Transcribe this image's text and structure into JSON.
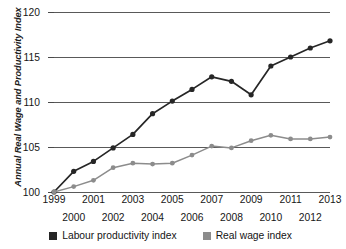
{
  "chart_data": {
    "type": "line",
    "title": "",
    "xlabel": "",
    "ylabel": "Annual Real Wage and Productivity Index",
    "ylim": [
      100,
      120
    ],
    "yticks": [
      100,
      105,
      110,
      115,
      120
    ],
    "grid": true,
    "legend_position": "bottom",
    "categories": [
      "1999",
      "2000",
      "2001",
      "2002",
      "2003",
      "2004",
      "2005",
      "2006",
      "2007",
      "2008",
      "2009",
      "2010",
      "2011",
      "2012",
      "2013"
    ],
    "series": [
      {
        "name": "Labour productivity index",
        "color": "#262626",
        "values": [
          100.0,
          102.3,
          103.4,
          104.9,
          106.4,
          108.7,
          110.1,
          111.4,
          112.8,
          112.3,
          110.8,
          114.0,
          115.0,
          116.0,
          116.8
        ]
      },
      {
        "name": "Real wage index",
        "color": "#8c8c8c",
        "values": [
          100.0,
          100.6,
          101.3,
          102.7,
          103.2,
          103.1,
          103.2,
          104.1,
          105.1,
          104.9,
          105.7,
          106.3,
          105.9,
          105.9,
          106.1
        ]
      }
    ]
  },
  "axes": {
    "ytick_labels": [
      "120",
      "115",
      "110",
      "105",
      "100"
    ],
    "xtick_labels": [
      "1999",
      "2000",
      "2001",
      "2002",
      "2003",
      "2004",
      "2005",
      "2006",
      "2007",
      "2008",
      "2009",
      "2010",
      "2011",
      "2012",
      "2013"
    ]
  },
  "legend": {
    "items": [
      {
        "label": "Labour productivity index",
        "color": "#262626"
      },
      {
        "label": "Real wage index",
        "color": "#8c8c8c"
      }
    ]
  }
}
